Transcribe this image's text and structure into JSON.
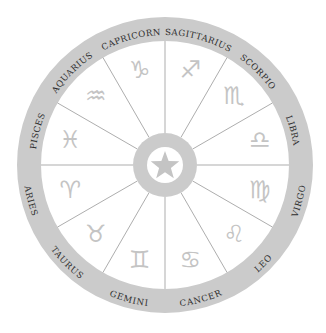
{
  "diagram": {
    "center": {
      "icon": "star-icon"
    },
    "colors": {
      "ring": "#cbcbcb",
      "glyph": "#c4c4c4",
      "divider": "#8a8a8a",
      "label": "#2e2e2e",
      "background": "#ffffff"
    },
    "signs": [
      {
        "name": "Sagittarius",
        "label": "SAGITTARIUS",
        "symbol": "♐",
        "angle": 15
      },
      {
        "name": "Scorpio",
        "label": "SCORPIO",
        "symbol": "♏",
        "angle": 45
      },
      {
        "name": "Libra",
        "label": "LIBRA",
        "symbol": "♎",
        "angle": 75
      },
      {
        "name": "Virgo",
        "label": "VIRGO",
        "symbol": "♍",
        "angle": 105
      },
      {
        "name": "Leo",
        "label": "LEO",
        "symbol": "♌",
        "angle": 135
      },
      {
        "name": "Cancer",
        "label": "CANCER",
        "symbol": "♋",
        "angle": 165
      },
      {
        "name": "Gemini",
        "label": "GEMINI",
        "symbol": "♊",
        "angle": 195
      },
      {
        "name": "Taurus",
        "label": "TAURUS",
        "symbol": "♉",
        "angle": 225
      },
      {
        "name": "Aries",
        "label": "ARIES",
        "symbol": "♈",
        "angle": 255
      },
      {
        "name": "Pisces",
        "label": "PISCES",
        "symbol": "♓",
        "angle": 285
      },
      {
        "name": "Aquarius",
        "label": "AQUARIUS",
        "symbol": "♒",
        "angle": 315
      },
      {
        "name": "Capricorn",
        "label": "CAPRICORN",
        "symbol": "♑",
        "angle": 345
      }
    ]
  }
}
